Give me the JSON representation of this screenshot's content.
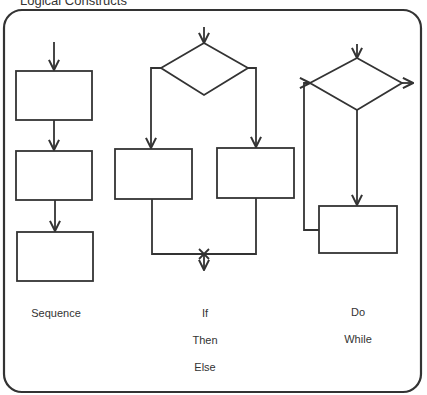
{
  "title": "Logical Constructs",
  "colors": {
    "stroke": "#333333",
    "background": "#ffffff",
    "text": "#333333"
  },
  "constructs": [
    {
      "name": "sequence",
      "labels": [
        "Sequence"
      ]
    },
    {
      "name": "if-then-else",
      "labels": [
        "If",
        "Then",
        "Else"
      ]
    },
    {
      "name": "do-while",
      "labels": [
        "Do",
        "While"
      ]
    }
  ]
}
